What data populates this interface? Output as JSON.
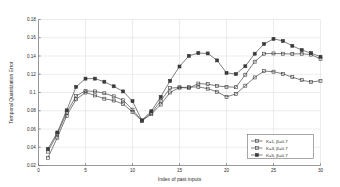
{
  "chart_data": {
    "type": "line",
    "title": "",
    "xlabel": "Index of past inputs",
    "ylabel": "Temporal Quantization Error",
    "xlim": [
      0,
      30
    ],
    "ylim": [
      0.02,
      0.18
    ],
    "xticks": [
      0,
      5,
      10,
      15,
      20,
      25,
      30
    ],
    "xtick_labels": [
      "0",
      "5",
      "10",
      "15",
      "20",
      "25",
      "30"
    ],
    "yticks": [
      0.02,
      0.04,
      0.06,
      0.08,
      0.1,
      0.12,
      0.14,
      0.16,
      0.18
    ],
    "ytick_labels": [
      "0.02",
      "0.04",
      "0.06",
      "0.08",
      "0.1",
      "0.12",
      "0.14",
      "0.16",
      "0.18"
    ],
    "grid": true,
    "legend_position": "lower right",
    "x": [
      1,
      2,
      3,
      4,
      5,
      6,
      7,
      8,
      9,
      10,
      11,
      12,
      13,
      14,
      15,
      16,
      17,
      18,
      19,
      20,
      21,
      22,
      23,
      24,
      25,
      26,
      27,
      28,
      29,
      30
    ],
    "series": [
      {
        "name": "K=1, β=0.7",
        "marker": "square",
        "values": [
          0.0285,
          0.0505,
          0.0745,
          0.0925,
          0.1,
          0.0968,
          0.0932,
          0.0912,
          0.0875,
          0.0785,
          0.069,
          0.0762,
          0.0868,
          0.1,
          0.1055,
          0.1058,
          0.1062,
          0.1042,
          0.1008,
          0.0952,
          0.0985,
          0.1075,
          0.1165,
          0.1235,
          0.1228,
          0.1205,
          0.1168,
          0.1135,
          0.1115,
          0.1128
        ]
      },
      {
        "name": "K=3, β=0.7",
        "marker": "square",
        "values": [
          0.0352,
          0.0545,
          0.0778,
          0.0962,
          0.1018,
          0.1012,
          0.0992,
          0.0958,
          0.0915,
          0.0812,
          0.0692,
          0.0775,
          0.0908,
          0.1048,
          0.1055,
          0.1048,
          0.1098,
          0.1092,
          0.1072,
          0.1062,
          0.1058,
          0.1195,
          0.1338,
          0.1425,
          0.1428,
          0.1425,
          0.1422,
          0.1425,
          0.1415,
          0.1368
        ]
      },
      {
        "name": "K=5, β=0.7",
        "marker": "square-filled",
        "values": [
          0.0382,
          0.0562,
          0.0805,
          0.1062,
          0.1152,
          0.1152,
          0.1118,
          0.1068,
          0.1012,
          0.0905,
          0.0695,
          0.0795,
          0.0952,
          0.1128,
          0.1285,
          0.1402,
          0.1432,
          0.1428,
          0.1352,
          0.1215,
          0.1202,
          0.1288,
          0.1425,
          0.1532,
          0.1588,
          0.1565,
          0.1512,
          0.1465,
          0.1432,
          0.1392
        ]
      }
    ]
  },
  "legend": {
    "entries": [
      {
        "label": "K=1, β=0.7"
      },
      {
        "label": "K=3, β=0.7"
      },
      {
        "label": "K=5, β=0.7"
      }
    ]
  }
}
